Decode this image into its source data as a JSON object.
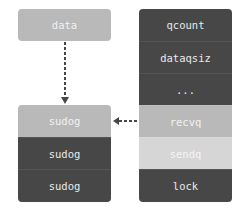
{
  "data_box": {
    "label": "data"
  },
  "sudog_list": {
    "items": [
      {
        "label": "sudog"
      },
      {
        "label": "sudog"
      },
      {
        "label": "sudog"
      }
    ]
  },
  "hchan": {
    "fields": [
      {
        "label": "qcount"
      },
      {
        "label": "dataqsiz"
      },
      {
        "label": "..."
      },
      {
        "label": "recvq"
      },
      {
        "label": "sendq"
      },
      {
        "label": "lock"
      }
    ]
  },
  "colors": {
    "dark": "#474747",
    "mid": "#b9b9b9",
    "light": "#d6d6d6",
    "arrow": "#474747"
  }
}
